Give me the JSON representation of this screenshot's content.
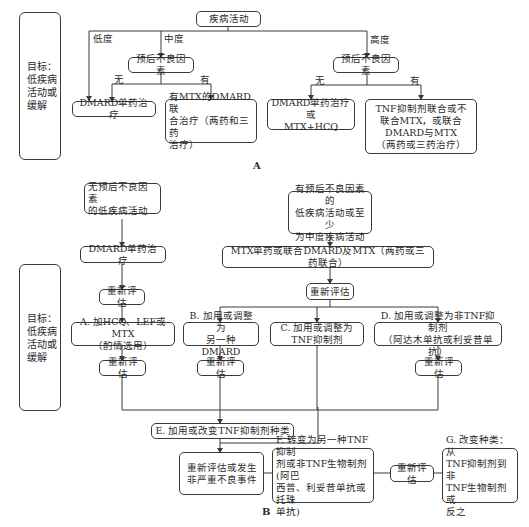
{
  "panel_a": {
    "label": "A",
    "goal": "目标：\n低疾病\n活动或\n缓解",
    "root": "疾病活动",
    "branches": {
      "low": "低度",
      "moderate": "中度",
      "high": "高度"
    },
    "prognosis_mid": "预后不良因素",
    "prognosis_high": "预后不良因素",
    "no_label": "无",
    "yes_label": "有",
    "low_result": "DMARD单药治疗",
    "mid_yes_result": "有MTX的DMARD联\n合治疗（两药和三药\n治疗）",
    "high_no_result": "DMARD单药治疗或\nMTX+HCQ",
    "high_yes_result": "TNF抑制剂联合或不\n联合MTX，或联合\nDMARD与MTX\n（两药或三药治疗）"
  },
  "panel_b": {
    "label": "B",
    "goal": "目标：\n低疾病\n活动或\n缓解",
    "start_left": "无预后不良因素\n的低疾病活动",
    "start_right": "有预后不良因素的\n低疾病活动或至少\n为中度疾病活动",
    "left_therapy": "DMARD单药治疗",
    "right_therapy": "MTX单药或联合DMARD及MTX（两药或三药联合）",
    "reassess": "重新评估",
    "option_a": "A. 加HCQ、LEF或MTX\n（酌情选用）",
    "option_b": "B. 加用或调整为\n另一种DMARD",
    "option_c": "C. 加用或调整为\nTNF抑制剂",
    "option_d": "D. 加用或调整为非TNF抑制剂\n（阿达木单抗或利妥昔单抗）",
    "option_e": "E. 加用或改变TNF抑制剂种类",
    "reassess_adverse": "重新评估或发生\n非严重不良事件",
    "option_f": "F. 转变为另一种TNF抑制\n剂或非TNF生物制剂(阿巴\n西普、利妥昔单抗或托珠\n单抗)",
    "option_g": "G. 改变种类：从\nTNF抑制剂到非\nTNF生物制剂或\n反之"
  }
}
